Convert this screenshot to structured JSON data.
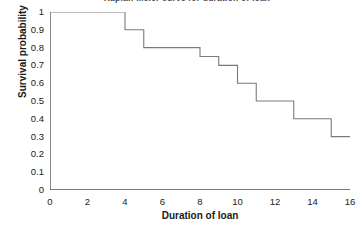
{
  "chart_data": {
    "type": "line",
    "subtype": "step",
    "title": "Kaplan-Meier curve for duration of loan",
    "xlabel": "Duration of loan",
    "ylabel": "Survival probability",
    "xlim": [
      0,
      16
    ],
    "ylim": [
      0,
      1
    ],
    "xticks": [
      0,
      2,
      4,
      6,
      8,
      10,
      12,
      14,
      16
    ],
    "xtick_labels": [
      "0",
      "2",
      "4",
      "6",
      "8",
      "10",
      "12",
      "14",
      "16"
    ],
    "yticks": [
      0,
      0.1,
      0.2,
      0.3,
      0.4,
      0.5,
      0.6,
      0.7,
      0.8,
      0.9,
      1
    ],
    "ytick_labels": [
      "0",
      "0.1",
      "0.2",
      "0.3",
      "0.4",
      "0.5",
      "0.6",
      "0.7",
      "0.8",
      "0.9",
      "1"
    ],
    "grid": false,
    "legend": "none",
    "line_color": "#7a7a7a",
    "axis_color": "#4d4d4d",
    "background": "#ffffff",
    "series": [
      {
        "name": "Survival probability",
        "x": [
          0,
          4,
          4,
          5,
          5,
          8,
          8,
          9,
          9,
          10,
          10,
          11,
          11,
          13,
          13,
          15,
          15,
          16
        ],
        "y": [
          1.0,
          1.0,
          0.9,
          0.9,
          0.8,
          0.8,
          0.75,
          0.75,
          0.7,
          0.7,
          0.6,
          0.6,
          0.5,
          0.5,
          0.4,
          0.4,
          0.3,
          0.3
        ],
        "steps": [
          {
            "time": 0,
            "survival": 1.0
          },
          {
            "time": 4,
            "survival": 0.9
          },
          {
            "time": 5,
            "survival": 0.8
          },
          {
            "time": 8,
            "survival": 0.75
          },
          {
            "time": 9,
            "survival": 0.7
          },
          {
            "time": 10,
            "survival": 0.6
          },
          {
            "time": 11,
            "survival": 0.5
          },
          {
            "time": 13,
            "survival": 0.4
          },
          {
            "time": 15,
            "survival": 0.3
          },
          {
            "time": 16,
            "survival": 0.3
          }
        ]
      }
    ]
  }
}
